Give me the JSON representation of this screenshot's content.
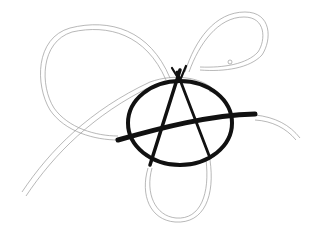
{
  "image": {
    "description": "Hand-drawn anarchy symbol (circled A) with a thick brush stroke crossing it, surrounded by thin double-line ribbon loops forming a trefoil knot shape",
    "colors": {
      "background": "#ffffff",
      "ink": "#111111",
      "pencil": "#9a9a9a"
    }
  }
}
